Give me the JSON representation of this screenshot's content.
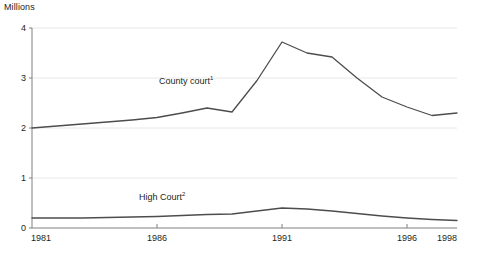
{
  "chart_data": {
    "type": "line",
    "title": "",
    "subtitle": "",
    "xlabel": "",
    "ylabel": "Millions",
    "unit_label": "Millions",
    "xlim": [
      1981,
      1998
    ],
    "ylim": [
      0,
      4
    ],
    "x_ticks": [
      1981,
      1986,
      1991,
      1996,
      1998
    ],
    "x_tick_labels": [
      "1981",
      "1986",
      "1991",
      "1996",
      "1998"
    ],
    "y_ticks": [
      0,
      1,
      2,
      3,
      4
    ],
    "y_tick_labels": [
      "0",
      "1",
      "2",
      "3",
      "4"
    ],
    "grid": "horizontal",
    "legend_position": "inline-annotation",
    "x": [
      1981,
      1982,
      1983,
      1984,
      1985,
      1986,
      1987,
      1988,
      1989,
      1990,
      1991,
      1992,
      1993,
      1994,
      1995,
      1996,
      1997,
      1998
    ],
    "series": [
      {
        "name": "County court",
        "footnote_marker": "1",
        "label": "County court",
        "color": "#4d4d4d",
        "values": [
          2.0,
          2.04,
          2.08,
          2.12,
          2.16,
          2.21,
          2.3,
          2.4,
          2.32,
          2.95,
          3.72,
          3.5,
          3.42,
          3.0,
          2.62,
          2.42,
          2.25,
          2.3
        ]
      },
      {
        "name": "High Court",
        "footnote_marker": "2",
        "label": "High Court",
        "color": "#4d4d4d",
        "values": [
          0.2,
          0.2,
          0.2,
          0.21,
          0.22,
          0.23,
          0.25,
          0.27,
          0.28,
          0.34,
          0.4,
          0.38,
          0.34,
          0.29,
          0.24,
          0.2,
          0.17,
          0.15
        ]
      }
    ],
    "annotations": [
      {
        "text": "County court",
        "marker": "1",
        "x": 1988,
        "y": 2.95
      },
      {
        "text": "High Court",
        "marker": "2",
        "x": 1987.2,
        "y": 0.62
      }
    ],
    "colors": {
      "line": "#4d4d4d",
      "axis": "#808080",
      "grid": "#e8e8e8",
      "text": "#231f20",
      "background": "#ffffff"
    }
  }
}
